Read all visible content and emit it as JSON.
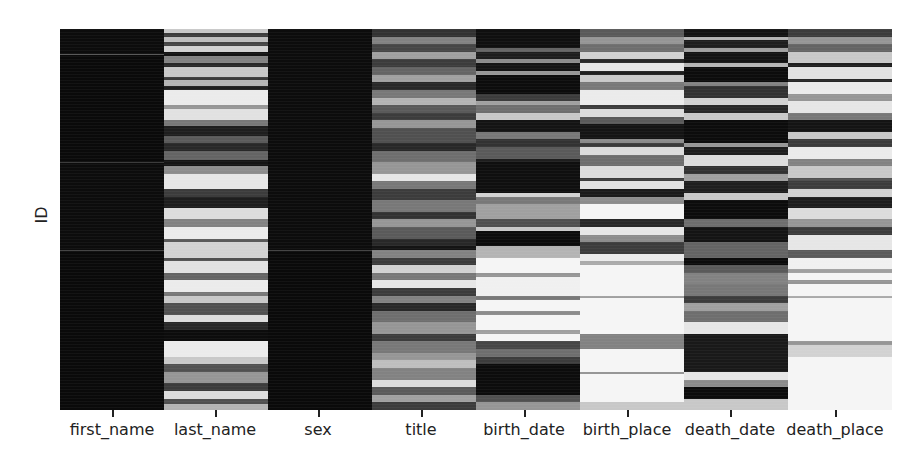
{
  "chart_data": {
    "type": "heatmap",
    "title": "",
    "subtitle": "Missing-value matrix (dark = value present, light = value missing)",
    "xlabel": "",
    "ylabel": "ID",
    "grid": false,
    "legend": null,
    "colormap": "grayscale (0 = black/present, 255 = white/missing)",
    "columns": [
      "first_name",
      "last_name",
      "sex",
      "title",
      "birth_date",
      "birth_place",
      "death_date",
      "death_place"
    ],
    "row_axis": {
      "label": "ID",
      "range": [
        0,
        1
      ],
      "ticks": []
    },
    "bands": {
      "first_name": [
        [
          0,
          0.065,
          12
        ],
        [
          0.065,
          0.068,
          90
        ],
        [
          0.068,
          0.35,
          10
        ],
        [
          0.35,
          0.352,
          60
        ],
        [
          0.352,
          0.58,
          12
        ],
        [
          0.58,
          0.582,
          70
        ],
        [
          0.582,
          1,
          10
        ]
      ],
      "last_name": [
        [
          0,
          0.01,
          200
        ],
        [
          0.01,
          0.02,
          60
        ],
        [
          0.02,
          0.035,
          190
        ],
        [
          0.035,
          0.045,
          70
        ],
        [
          0.045,
          0.06,
          210
        ],
        [
          0.06,
          0.07,
          20
        ],
        [
          0.07,
          0.09,
          130
        ],
        [
          0.09,
          0.1,
          40
        ],
        [
          0.1,
          0.125,
          200
        ],
        [
          0.125,
          0.135,
          60
        ],
        [
          0.135,
          0.15,
          180
        ],
        [
          0.15,
          0.16,
          30
        ],
        [
          0.16,
          0.2,
          235
        ],
        [
          0.2,
          0.21,
          150
        ],
        [
          0.21,
          0.24,
          225
        ],
        [
          0.24,
          0.255,
          120
        ],
        [
          0.255,
          0.28,
          30
        ],
        [
          0.28,
          0.3,
          90
        ],
        [
          0.3,
          0.32,
          40
        ],
        [
          0.32,
          0.345,
          100
        ],
        [
          0.345,
          0.36,
          20
        ],
        [
          0.36,
          0.38,
          140
        ],
        [
          0.38,
          0.42,
          230
        ],
        [
          0.42,
          0.44,
          60
        ],
        [
          0.44,
          0.47,
          30
        ],
        [
          0.47,
          0.5,
          220
        ],
        [
          0.5,
          0.52,
          130
        ],
        [
          0.52,
          0.55,
          235
        ],
        [
          0.55,
          0.56,
          90
        ],
        [
          0.56,
          0.6,
          210
        ],
        [
          0.6,
          0.61,
          80
        ],
        [
          0.61,
          0.64,
          225
        ],
        [
          0.64,
          0.66,
          100
        ],
        [
          0.66,
          0.69,
          235
        ],
        [
          0.69,
          0.7,
          120
        ],
        [
          0.7,
          0.72,
          200
        ],
        [
          0.72,
          0.75,
          80
        ],
        [
          0.75,
          0.77,
          220
        ],
        [
          0.77,
          0.79,
          40
        ],
        [
          0.79,
          0.82,
          12
        ],
        [
          0.82,
          0.86,
          235
        ],
        [
          0.86,
          0.88,
          200
        ],
        [
          0.88,
          0.9,
          80
        ],
        [
          0.9,
          0.93,
          150
        ],
        [
          0.93,
          0.95,
          60
        ],
        [
          0.95,
          0.97,
          220
        ],
        [
          0.97,
          0.985,
          80
        ],
        [
          0.985,
          1,
          180
        ]
      ],
      "sex": [
        [
          0,
          0.58,
          12
        ],
        [
          0.58,
          0.583,
          70
        ],
        [
          0.583,
          1,
          10
        ]
      ],
      "title": [
        [
          0,
          0.02,
          50
        ],
        [
          0.02,
          0.04,
          130
        ],
        [
          0.04,
          0.06,
          70
        ],
        [
          0.06,
          0.08,
          160
        ],
        [
          0.08,
          0.1,
          60
        ],
        [
          0.1,
          0.12,
          100
        ],
        [
          0.12,
          0.14,
          160
        ],
        [
          0.14,
          0.16,
          40
        ],
        [
          0.16,
          0.18,
          120
        ],
        [
          0.18,
          0.2,
          180
        ],
        [
          0.2,
          0.22,
          90
        ],
        [
          0.22,
          0.24,
          60
        ],
        [
          0.24,
          0.26,
          150
        ],
        [
          0.26,
          0.3,
          80
        ],
        [
          0.3,
          0.32,
          40
        ],
        [
          0.32,
          0.35,
          110
        ],
        [
          0.35,
          0.38,
          150
        ],
        [
          0.38,
          0.4,
          230
        ],
        [
          0.4,
          0.42,
          120
        ],
        [
          0.42,
          0.45,
          60
        ],
        [
          0.45,
          0.48,
          120
        ],
        [
          0.48,
          0.5,
          50
        ],
        [
          0.5,
          0.52,
          150
        ],
        [
          0.52,
          0.55,
          90
        ],
        [
          0.55,
          0.57,
          40
        ],
        [
          0.57,
          0.58,
          20
        ],
        [
          0.58,
          0.6,
          130
        ],
        [
          0.6,
          0.62,
          60
        ],
        [
          0.62,
          0.64,
          210
        ],
        [
          0.64,
          0.66,
          120
        ],
        [
          0.66,
          0.68,
          230
        ],
        [
          0.68,
          0.7,
          60
        ],
        [
          0.7,
          0.72,
          130
        ],
        [
          0.72,
          0.74,
          40
        ],
        [
          0.74,
          0.77,
          110
        ],
        [
          0.77,
          0.8,
          150
        ],
        [
          0.8,
          0.82,
          60
        ],
        [
          0.82,
          0.85,
          120
        ],
        [
          0.85,
          0.87,
          150
        ],
        [
          0.87,
          0.89,
          190
        ],
        [
          0.89,
          0.92,
          130
        ],
        [
          0.92,
          0.94,
          220
        ],
        [
          0.94,
          0.96,
          90
        ],
        [
          0.96,
          0.98,
          160
        ],
        [
          0.98,
          1,
          60
        ]
      ],
      "birth_date": [
        [
          0,
          0.05,
          15
        ],
        [
          0.05,
          0.06,
          100
        ],
        [
          0.06,
          0.08,
          30
        ],
        [
          0.08,
          0.09,
          140
        ],
        [
          0.09,
          0.11,
          20
        ],
        [
          0.11,
          0.12,
          150
        ],
        [
          0.12,
          0.17,
          12
        ],
        [
          0.17,
          0.19,
          60
        ],
        [
          0.19,
          0.2,
          160
        ],
        [
          0.2,
          0.22,
          110
        ],
        [
          0.22,
          0.24,
          200
        ],
        [
          0.24,
          0.27,
          20
        ],
        [
          0.27,
          0.29,
          120
        ],
        [
          0.29,
          0.31,
          50
        ],
        [
          0.31,
          0.34,
          90
        ],
        [
          0.34,
          0.35,
          30
        ],
        [
          0.35,
          0.43,
          15
        ],
        [
          0.43,
          0.44,
          210
        ],
        [
          0.44,
          0.46,
          120
        ],
        [
          0.46,
          0.5,
          160
        ],
        [
          0.5,
          0.52,
          80
        ],
        [
          0.52,
          0.53,
          200
        ],
        [
          0.53,
          0.57,
          12
        ],
        [
          0.57,
          0.6,
          180
        ],
        [
          0.6,
          0.64,
          245
        ],
        [
          0.64,
          0.65,
          150
        ],
        [
          0.65,
          0.7,
          240
        ],
        [
          0.7,
          0.71,
          120
        ],
        [
          0.71,
          0.74,
          245
        ],
        [
          0.74,
          0.75,
          140
        ],
        [
          0.75,
          0.79,
          245
        ],
        [
          0.79,
          0.8,
          160
        ],
        [
          0.8,
          0.82,
          245
        ],
        [
          0.82,
          0.84,
          70
        ],
        [
          0.84,
          0.86,
          110
        ],
        [
          0.86,
          0.88,
          60
        ],
        [
          0.88,
          0.96,
          12
        ],
        [
          0.96,
          0.98,
          80
        ],
        [
          0.98,
          1,
          150
        ]
      ],
      "birth_place": [
        [
          0,
          0.02,
          90
        ],
        [
          0.02,
          0.04,
          150
        ],
        [
          0.04,
          0.06,
          110
        ],
        [
          0.06,
          0.08,
          210
        ],
        [
          0.08,
          0.09,
          40
        ],
        [
          0.09,
          0.11,
          230
        ],
        [
          0.11,
          0.12,
          30
        ],
        [
          0.12,
          0.14,
          200
        ],
        [
          0.14,
          0.16,
          120
        ],
        [
          0.16,
          0.2,
          235
        ],
        [
          0.2,
          0.21,
          60
        ],
        [
          0.21,
          0.23,
          220
        ],
        [
          0.23,
          0.25,
          90
        ],
        [
          0.25,
          0.29,
          20
        ],
        [
          0.29,
          0.3,
          140
        ],
        [
          0.3,
          0.31,
          60
        ],
        [
          0.31,
          0.33,
          220
        ],
        [
          0.33,
          0.36,
          110
        ],
        [
          0.36,
          0.39,
          220
        ],
        [
          0.39,
          0.4,
          60
        ],
        [
          0.4,
          0.42,
          225
        ],
        [
          0.42,
          0.44,
          25
        ],
        [
          0.44,
          0.46,
          140
        ],
        [
          0.46,
          0.5,
          245
        ],
        [
          0.5,
          0.52,
          40
        ],
        [
          0.52,
          0.54,
          230
        ],
        [
          0.54,
          0.56,
          140
        ],
        [
          0.56,
          0.59,
          60
        ],
        [
          0.59,
          0.61,
          235
        ],
        [
          0.61,
          0.62,
          170
        ],
        [
          0.62,
          0.7,
          245
        ],
        [
          0.7,
          0.705,
          160
        ],
        [
          0.705,
          0.8,
          245
        ],
        [
          0.8,
          0.84,
          130
        ],
        [
          0.84,
          0.9,
          245
        ],
        [
          0.9,
          0.905,
          150
        ],
        [
          0.905,
          0.98,
          245
        ],
        [
          0.98,
          1,
          200
        ]
      ],
      "death_date": [
        [
          0,
          0.02,
          20
        ],
        [
          0.02,
          0.03,
          180
        ],
        [
          0.03,
          0.05,
          30
        ],
        [
          0.05,
          0.06,
          160
        ],
        [
          0.06,
          0.09,
          20
        ],
        [
          0.09,
          0.1,
          180
        ],
        [
          0.1,
          0.14,
          12
        ],
        [
          0.14,
          0.15,
          130
        ],
        [
          0.15,
          0.18,
          50
        ],
        [
          0.18,
          0.2,
          210
        ],
        [
          0.2,
          0.22,
          40
        ],
        [
          0.22,
          0.24,
          200
        ],
        [
          0.24,
          0.3,
          12
        ],
        [
          0.3,
          0.31,
          150
        ],
        [
          0.31,
          0.33,
          30
        ],
        [
          0.33,
          0.36,
          220
        ],
        [
          0.36,
          0.38,
          50
        ],
        [
          0.38,
          0.4,
          160
        ],
        [
          0.4,
          0.43,
          30
        ],
        [
          0.43,
          0.45,
          200
        ],
        [
          0.45,
          0.5,
          12
        ],
        [
          0.5,
          0.52,
          110
        ],
        [
          0.52,
          0.56,
          20
        ],
        [
          0.56,
          0.6,
          100
        ],
        [
          0.6,
          0.62,
          12
        ],
        [
          0.62,
          0.64,
          90
        ],
        [
          0.64,
          0.67,
          130
        ],
        [
          0.67,
          0.7,
          120
        ],
        [
          0.7,
          0.72,
          60
        ],
        [
          0.72,
          0.74,
          160
        ],
        [
          0.74,
          0.77,
          110
        ],
        [
          0.77,
          0.8,
          230
        ],
        [
          0.8,
          0.9,
          25
        ],
        [
          0.9,
          0.92,
          230
        ],
        [
          0.92,
          0.94,
          140
        ],
        [
          0.94,
          0.97,
          12
        ],
        [
          0.97,
          1,
          200
        ]
      ],
      "death_place": [
        [
          0,
          0.02,
          60
        ],
        [
          0.02,
          0.04,
          150
        ],
        [
          0.04,
          0.06,
          100
        ],
        [
          0.06,
          0.09,
          200
        ],
        [
          0.09,
          0.1,
          30
        ],
        [
          0.1,
          0.13,
          225
        ],
        [
          0.13,
          0.14,
          40
        ],
        [
          0.14,
          0.17,
          235
        ],
        [
          0.17,
          0.19,
          150
        ],
        [
          0.19,
          0.22,
          230
        ],
        [
          0.22,
          0.24,
          120
        ],
        [
          0.24,
          0.27,
          20
        ],
        [
          0.27,
          0.29,
          200
        ],
        [
          0.29,
          0.31,
          60
        ],
        [
          0.31,
          0.34,
          235
        ],
        [
          0.34,
          0.36,
          130
        ],
        [
          0.36,
          0.39,
          200
        ],
        [
          0.39,
          0.4,
          80
        ],
        [
          0.4,
          0.42,
          60
        ],
        [
          0.42,
          0.44,
          210
        ],
        [
          0.44,
          0.47,
          30
        ],
        [
          0.47,
          0.5,
          220
        ],
        [
          0.5,
          0.52,
          150
        ],
        [
          0.52,
          0.54,
          60
        ],
        [
          0.54,
          0.58,
          230
        ],
        [
          0.58,
          0.6,
          90
        ],
        [
          0.6,
          0.63,
          240
        ],
        [
          0.63,
          0.64,
          160
        ],
        [
          0.64,
          0.66,
          245
        ],
        [
          0.66,
          0.67,
          150
        ],
        [
          0.67,
          0.7,
          245
        ],
        [
          0.7,
          0.705,
          170
        ],
        [
          0.705,
          0.82,
          245
        ],
        [
          0.82,
          0.83,
          150
        ],
        [
          0.83,
          0.86,
          210
        ],
        [
          0.86,
          1,
          245
        ]
      ]
    },
    "missing_fraction_estimate": {
      "first_name": 0.0,
      "last_name": 0.5,
      "sex": 0.0,
      "title": 0.45,
      "birth_date": 0.4,
      "birth_place": 0.75,
      "death_date": 0.35,
      "death_place": 0.8
    }
  },
  "axes": {
    "ylabel": "ID",
    "xticks": [
      "first_name",
      "last_name",
      "sex",
      "title",
      "birth_date",
      "birth_place",
      "death_date",
      "death_place"
    ]
  }
}
